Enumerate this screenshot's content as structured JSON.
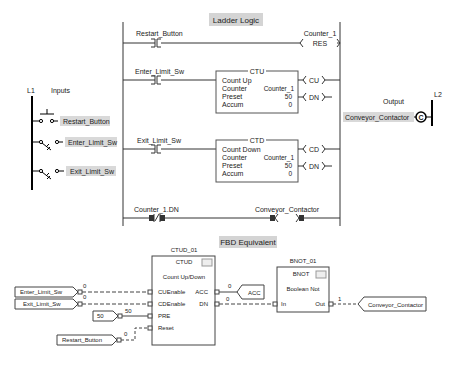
{
  "ladder": {
    "title": "Ladder Logic",
    "rungs": [
      {
        "contact": "Restart_Button",
        "coil_tag": "Counter_1",
        "coil": "RES"
      },
      {
        "contact": "Enter_Limit_Sw",
        "block": {
          "type": "CTU",
          "desc": "Count Up",
          "counter_label": "Counter",
          "counter": "Counter_1",
          "preset_label": "Preset",
          "preset": "50",
          "accum_label": "Accum",
          "accum": "0"
        },
        "outputs": [
          "CU",
          "DN"
        ]
      },
      {
        "contact": "Exit_Limit_Sw",
        "block": {
          "type": "CTD",
          "desc": "Count Down",
          "counter_label": "Counter",
          "counter": "Counter_1",
          "preset_label": "Preset",
          "preset": "50",
          "accum_label": "Accum",
          "accum": "0"
        },
        "outputs": [
          "CD",
          "DN"
        ]
      },
      {
        "contact": "Counter_1.DN",
        "coil_tag": "Conveyor_Contactor"
      }
    ]
  },
  "inputs": {
    "rail": "L1",
    "title": "Inputs",
    "items": [
      "Restart_Button",
      "Enter_Limit_Sw",
      "Exit_Limit_Sw"
    ]
  },
  "outputs": {
    "rail": "L2",
    "title": "Output",
    "item": "Conveyor_Contactor",
    "coil_letter": "C"
  },
  "fbd": {
    "title": "FBD Equivalent",
    "ctud": {
      "name": "CTUD_01",
      "type": "CTUD",
      "desc": "Count Up/Down",
      "inputs": [
        "CUEnable",
        "CDEnable",
        "PRE",
        "Reset"
      ],
      "outputs": [
        "ACC",
        "DN"
      ]
    },
    "bnot": {
      "name": "BNOT_01",
      "type": "BNOT",
      "desc": "Boolean Not",
      "input": "In",
      "output": "Out"
    },
    "input_refs": [
      "Enter_Limit_Sw",
      "Exit_Limit_Sw",
      "Restart_Button"
    ],
    "const_pre": "50",
    "output_refs": [
      "ACC",
      "Conveyor_Contactor"
    ],
    "wire_values": {
      "cu": "0",
      "cd": "0",
      "pre": "50",
      "reset": "0",
      "acc": "0",
      "dn": "0",
      "out": "1"
    }
  }
}
